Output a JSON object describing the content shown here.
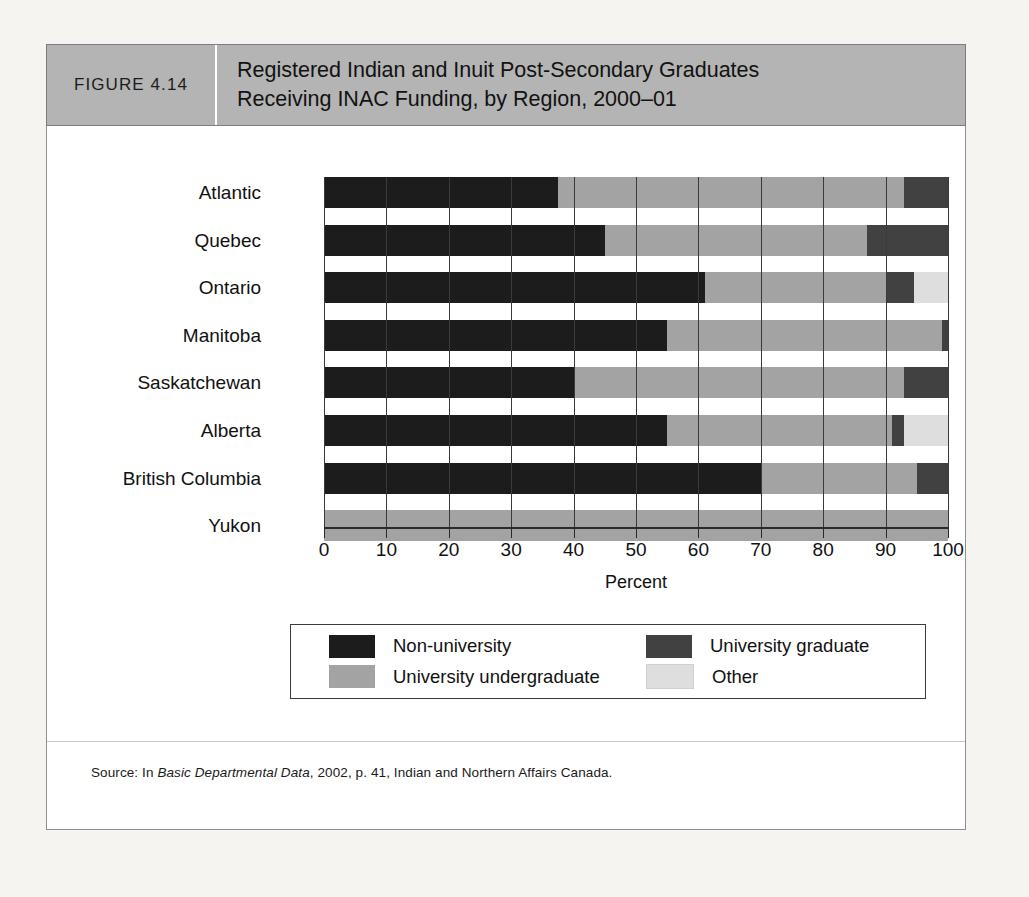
{
  "figure": {
    "number": "FIGURE 4.14",
    "title_line1": "Registered Indian and Inuit Post-Secondary Graduates",
    "title_line2": "Receiving INAC Funding, by Region, 2000–01"
  },
  "source": {
    "prefix": "Source: In ",
    "italic": "Basic Departmental Data",
    "suffix": ", 2002, p. 41, Indian and Northern Affairs Canada."
  },
  "colors": {
    "non_university": "#1c1c1c",
    "university_undergraduate": "#a3a3a3",
    "university_graduate": "#414141",
    "other": "#dedede",
    "header_band": "#b4b4b4",
    "page_background": "#f6f4f0",
    "frame_border": "#8f8f8f",
    "axis": "#2a2a2a"
  },
  "chart_data": {
    "type": "bar",
    "orientation": "horizontal",
    "stacked": true,
    "stack_total": 100,
    "title": "Registered Indian and Inuit Post-Secondary Graduates Receiving INAC Funding, by Region, 2000–01",
    "xlabel": "Percent",
    "ylabel": "",
    "xlim": [
      0,
      100
    ],
    "xticks": [
      0,
      10,
      20,
      30,
      40,
      50,
      60,
      70,
      80,
      90,
      100
    ],
    "xtick_labels": [
      "0",
      "10",
      "20",
      "30",
      "40",
      "50",
      "60",
      "70",
      "80",
      "90",
      "100"
    ],
    "grid": true,
    "grid_axis": "x",
    "legend_position": "bottom",
    "categories": [
      "Atlantic",
      "Quebec",
      "Ontario",
      "Manitoba",
      "Saskatchewan",
      "Alberta",
      "British Columbia",
      "Yukon"
    ],
    "series": [
      {
        "name": "Non-university",
        "color": "#1c1c1c",
        "values": [
          37.5,
          45,
          61,
          55,
          40,
          55,
          70,
          0
        ]
      },
      {
        "name": "University undergraduate",
        "color": "#a3a3a3",
        "values": [
          55.5,
          42,
          29,
          44,
          53,
          36,
          25,
          100
        ]
      },
      {
        "name": "University graduate",
        "color": "#414141",
        "values": [
          7,
          13,
          4.5,
          1,
          7,
          2,
          5,
          0
        ]
      },
      {
        "name": "Other",
        "color": "#dedede",
        "values": [
          0,
          0,
          5.5,
          0,
          0,
          7,
          0,
          0
        ]
      }
    ]
  },
  "legend": {
    "items": [
      {
        "label": "Non-university",
        "color": "#1c1c1c"
      },
      {
        "label": "University graduate",
        "color": "#414141"
      },
      {
        "label": "University undergraduate",
        "color": "#a3a3a3"
      },
      {
        "label": "Other",
        "color": "#dedede"
      }
    ]
  }
}
